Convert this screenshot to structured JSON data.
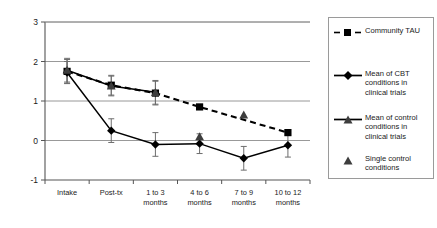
{
  "chart_data": {
    "type": "line",
    "title": "",
    "xlabel": "",
    "ylabel": "",
    "ylim": [
      -1,
      3
    ],
    "yticks": [
      -1,
      0,
      1,
      2,
      3
    ],
    "ytick_labels": [
      "-1",
      "0",
      "1",
      "2",
      "3"
    ],
    "grid": true,
    "legend_position": "right",
    "categories": [
      "Intake",
      "Post-tx",
      "1 to 3\nmonths",
      "4 to 6\nmonths",
      "7 to 9\nmonths",
      "10 to 12\nmonths"
    ],
    "category_lines": [
      [
        "Intake"
      ],
      [
        "Post-tx"
      ],
      [
        "1 to 3",
        "months"
      ],
      [
        "4 to 6",
        "months"
      ],
      [
        "7 to 9",
        "months"
      ],
      [
        "10 to 12",
        "months"
      ]
    ],
    "series": [
      {
        "name": "Community TAU",
        "marker": "square",
        "linestyle": "dashed",
        "color": "#000000",
        "x": [
          0,
          1,
          2,
          3,
          5
        ],
        "values": [
          1.75,
          1.4,
          1.2,
          0.85,
          0.2
        ],
        "errors": [
          0.3,
          0.25,
          0.3,
          0.0,
          0.0
        ]
      },
      {
        "name": "Mean of CBT conditions in clinical trials",
        "marker": "diamond",
        "linestyle": "solid",
        "color": "#000000",
        "x": [
          0,
          1,
          2,
          3,
          4,
          5
        ],
        "values": [
          1.72,
          0.25,
          -0.1,
          -0.08,
          -0.45,
          -0.12
        ],
        "errors": [
          0.28,
          0.3,
          0.3,
          0.25,
          0.3,
          0.3
        ]
      },
      {
        "name": "Mean of control conditions in clinical trials",
        "marker": "triangle",
        "linestyle": "solid",
        "color": "#3d3d3d",
        "x": [
          0,
          1,
          2
        ],
        "values": [
          1.78,
          1.38,
          1.22
        ],
        "errors": [
          0.3,
          0.25,
          0.3
        ]
      },
      {
        "name": "Single control conditions",
        "marker": "triangle",
        "linestyle": "none",
        "color": "#3d3d3d",
        "x": [
          3,
          4
        ],
        "values": [
          0.1,
          0.65
        ],
        "errors": [
          0.0,
          0.0
        ]
      }
    ]
  },
  "legend": {
    "entries": [
      {
        "label": "Community TAU",
        "key": "dashed-square"
      },
      {
        "label": "Mean of CBT conditions in clinical trials",
        "key": "solid-diamond"
      },
      {
        "label": "Mean of control conditions in clinical trials",
        "key": "solid-triangle"
      },
      {
        "label": "Single control conditions",
        "key": "marker-triangle"
      }
    ]
  }
}
